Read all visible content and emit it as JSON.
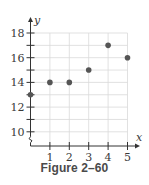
{
  "chart_data": {
    "type": "scatter",
    "title": "",
    "caption": "Figure 2–60",
    "xlabel": "x",
    "ylabel": "y",
    "x": [
      0,
      1,
      2,
      3,
      4,
      5
    ],
    "y": [
      13,
      14,
      14,
      15,
      17,
      16
    ],
    "points": [
      {
        "x": 0,
        "y": 13
      },
      {
        "x": 1,
        "y": 14
      },
      {
        "x": 2,
        "y": 14
      },
      {
        "x": 3,
        "y": 15
      },
      {
        "x": 4,
        "y": 17
      },
      {
        "x": 5,
        "y": 16
      }
    ],
    "x_ticks": [
      1,
      2,
      3,
      4,
      5
    ],
    "y_ticks": [
      10,
      12,
      14,
      16,
      18
    ],
    "y_minor_ticks": [
      11,
      13,
      15,
      17
    ],
    "xlim": [
      0,
      5
    ],
    "ylim": [
      9,
      18
    ],
    "y_axis_break": true,
    "grid": true,
    "legend": null,
    "colors": {
      "point": "#555555",
      "axis": "#333333",
      "grid": "#d9d9d9"
    }
  }
}
